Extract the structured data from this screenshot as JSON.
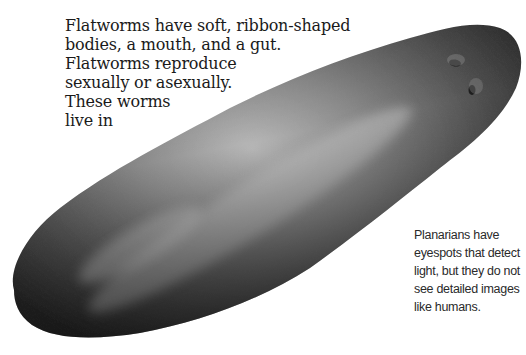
{
  "main_text": {
    "lines": [
      "Flatworms have soft, ribbon-shaped",
      "bodies, a mouth, and a gut.",
      "Flatworms reproduce",
      "sexually or asexually.",
      "These worms",
      "live in"
    ]
  },
  "caption": {
    "lines": [
      "Planarians have",
      "eyespots that detect",
      "light, but they do not",
      "see detailed images",
      "like humans."
    ]
  },
  "figure": {
    "colors": {
      "body_dark": "#2b2b2b",
      "body_mid": "#6e6e6e",
      "body_light": "#b5b5b5",
      "eyespot": "#1c1c1c",
      "background": "#ffffff"
    }
  }
}
